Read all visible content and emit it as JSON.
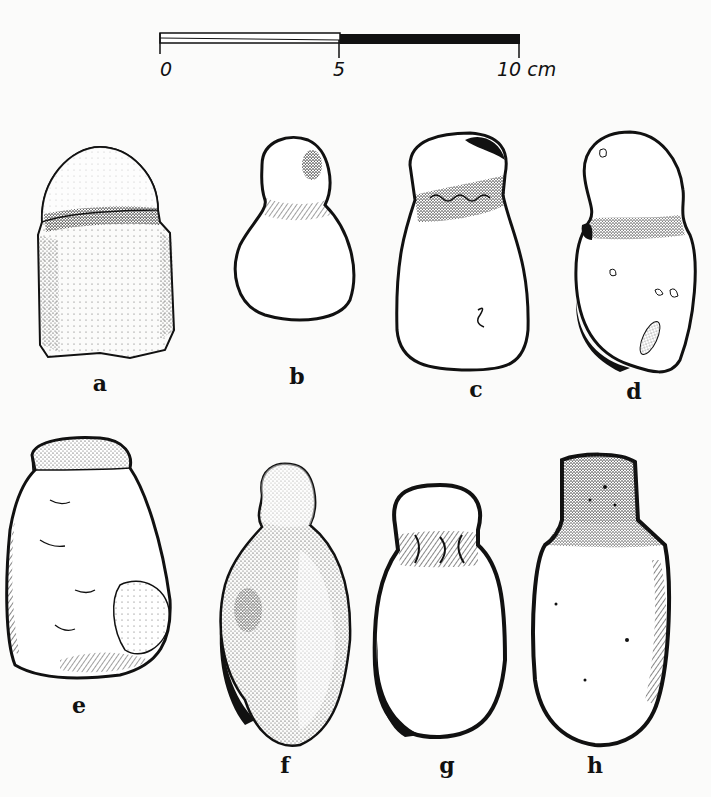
{
  "scale_bar": {
    "ticks": [
      {
        "label": "0",
        "x": 160
      },
      {
        "label": "5",
        "x": 339
      },
      {
        "label": "10 cm",
        "x": 519
      }
    ],
    "segments": [
      {
        "from": "0",
        "to": "5",
        "fill": "#ffffff"
      },
      {
        "from": "5",
        "to": "10",
        "fill": "#111111"
      }
    ],
    "unit": "cm"
  },
  "figures": [
    {
      "id": "a",
      "label": "a",
      "description": "stone with rounded cap and dotted band, rectangular body"
    },
    {
      "id": "b",
      "label": "b",
      "description": "pear-shaped stone with narrow head"
    },
    {
      "id": "c",
      "label": "c",
      "description": "stone with rounded head and textured neck band"
    },
    {
      "id": "d",
      "label": "d",
      "description": "elongated two-lobed stone with inclusions"
    },
    {
      "id": "e",
      "label": "e",
      "description": "irregular faceted stone with flat top"
    },
    {
      "id": "f",
      "label": "f",
      "description": "stippled stone with small knob head"
    },
    {
      "id": "g",
      "label": "g",
      "description": "oval stone with round head and grooved neck"
    },
    {
      "id": "h",
      "label": "h",
      "description": "elongated stone with square stippled head"
    }
  ],
  "colors": {
    "ink": "#111111",
    "paper": "#fbfbfa"
  }
}
